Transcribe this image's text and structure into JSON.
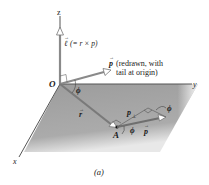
{
  "figure": {
    "caption": "(a)",
    "axes": {
      "x": "x",
      "y": "y",
      "z": "z"
    },
    "origin_label": "O",
    "point_label": "A",
    "angle_label": "ϕ",
    "angular_momentum_label": "ℓ (= r × p)",
    "angular_momentum_symbol": "ℓ",
    "angular_momentum_expr": "(= r × p)",
    "p_redrawn_symbol": "p",
    "p_redrawn_note_line1": "(redrawn, with",
    "p_redrawn_note_line2": "tail at origin)",
    "r_label": "r",
    "p_label": "p",
    "p_perp_label": "p⊥",
    "p_perp_symbol": "p",
    "p_perp_sub": "⊥",
    "colors": {
      "plane": "#a9a9a9",
      "vector": "#7a7a7a",
      "axis": "#555555",
      "text": "#1a1a1a"
    }
  }
}
